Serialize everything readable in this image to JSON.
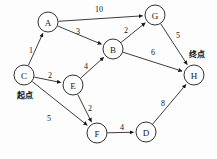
{
  "diagram": {
    "type": "directed-weighted-graph",
    "canvas": {
      "width": 217,
      "height": 159
    },
    "colors": {
      "stroke": "#1a1a1a",
      "node_fill": "#ffffff",
      "text": "#151515",
      "background": "#fdfdfd"
    },
    "nodes": [
      {
        "id": "A",
        "label": "A",
        "cx": 48,
        "cy": 22,
        "r": 10
      },
      {
        "id": "G",
        "label": "G",
        "cx": 155,
        "cy": 15,
        "r": 10
      },
      {
        "id": "B",
        "label": "B",
        "cx": 113,
        "cy": 49,
        "r": 10
      },
      {
        "id": "C",
        "label": "C",
        "cx": 24,
        "cy": 75,
        "r": 10
      },
      {
        "id": "E",
        "label": "E",
        "cx": 73,
        "cy": 85,
        "r": 10
      },
      {
        "id": "H",
        "label": "H",
        "cx": 194,
        "cy": 75,
        "r": 10
      },
      {
        "id": "F",
        "label": "F",
        "cx": 97,
        "cy": 133,
        "r": 10
      },
      {
        "id": "D",
        "label": "D",
        "cx": 146,
        "cy": 132,
        "r": 10
      }
    ],
    "edges": [
      {
        "id": "A-G",
        "from": "A",
        "to": "G",
        "weight": "10",
        "lx": 99,
        "ly": 9
      },
      {
        "id": "A-B",
        "from": "A",
        "to": "B",
        "weight": "3",
        "lx": 78,
        "ly": 31
      },
      {
        "id": "C-A",
        "from": "C",
        "to": "A",
        "weight": "1",
        "lx": 31,
        "ly": 50
      },
      {
        "id": "C-E",
        "from": "C",
        "to": "E",
        "weight": "2",
        "lx": 50,
        "ly": 75
      },
      {
        "id": "C-F",
        "from": "C",
        "to": "F",
        "weight": "5",
        "lx": 49,
        "ly": 118
      },
      {
        "id": "E-B",
        "from": "E",
        "to": "B",
        "weight": "4",
        "lx": 86,
        "ly": 66
      },
      {
        "id": "E-F",
        "from": "E",
        "to": "F",
        "weight": "2",
        "lx": 90,
        "ly": 108
      },
      {
        "id": "B-G",
        "from": "B",
        "to": "G",
        "weight": "2",
        "lx": 126,
        "ly": 30
      },
      {
        "id": "B-H",
        "from": "B",
        "to": "H",
        "weight": "6",
        "lx": 153,
        "ly": 52
      },
      {
        "id": "G-H",
        "from": "G",
        "to": "H",
        "weight": "5",
        "lx": 178,
        "ly": 35
      },
      {
        "id": "F-D",
        "from": "F",
        "to": "D",
        "weight": "4",
        "lx": 122,
        "ly": 127
      },
      {
        "id": "D-H",
        "from": "D",
        "to": "H",
        "weight": "8",
        "lx": 163,
        "ly": 103
      }
    ],
    "annotations": [
      {
        "id": "start",
        "text": "起点",
        "x": 25,
        "y": 95
      },
      {
        "id": "end",
        "text": "终点",
        "x": 197,
        "y": 54
      }
    ]
  }
}
